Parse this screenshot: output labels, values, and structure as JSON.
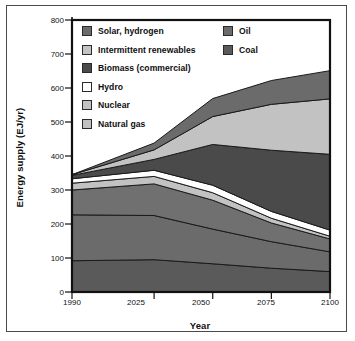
{
  "figure": {
    "axis": {
      "ylabel": "Energy supply (EJ/yr)",
      "xlabel": "Year",
      "yticks": [
        "800",
        "700",
        "600",
        "500",
        "400",
        "300",
        "200",
        "100",
        "0"
      ],
      "xticks": [
        "1990",
        "2025",
        "2050",
        "2075",
        "2100"
      ]
    },
    "legend": {
      "left_column": [
        {
          "label": "Solar, hydrogen",
          "swatch": "#6b6b6b"
        },
        {
          "label": "Intermittent renewables",
          "swatch": "#c2c2c2"
        },
        {
          "label": "Biomass (commercial)",
          "swatch": "#4a4a4a"
        },
        {
          "label": "Hydro",
          "swatch": "#ffffff"
        },
        {
          "label": "Nuclear",
          "swatch": "#c2c2c2"
        },
        {
          "label": "Natural gas",
          "swatch": "#c2c2c2"
        }
      ],
      "right_column": [
        {
          "label": "Oil",
          "swatch": "#6b6b6b"
        },
        {
          "label": "Coal",
          "swatch": "#5a5a5a"
        }
      ]
    },
    "colors": {
      "solar_hydrogen": "#6b6b6b",
      "intermittent_renewables": "#c2c2c2",
      "biomass_commercial": "#4a4a4a",
      "hydro": "#ffffff",
      "nuclear": "#c2c2c2",
      "natural_gas": "#707070",
      "oil": "#6b6b6b",
      "coal": "#5a5a5a",
      "frame": "#111111",
      "outer_frame": "#4a4a4a",
      "background": "#ffffff"
    }
  },
  "chart_data": {
    "type": "area",
    "title": "",
    "xlabel": "Year",
    "ylabel": "Energy supply (EJ/yr)",
    "xlim": [
      1990,
      2100
    ],
    "ylim": [
      0,
      800
    ],
    "xticks": [
      1990,
      2025,
      2050,
      2075,
      2100
    ],
    "yticks": [
      0,
      100,
      200,
      300,
      400,
      500,
      600,
      700,
      800
    ],
    "grid": false,
    "legend_position": "top-inside",
    "stacked": true,
    "stack_order_bottom_to_top": [
      "Coal",
      "Oil",
      "Natural gas",
      "Nuclear",
      "Hydro",
      "Biomass (commercial)",
      "Intermittent renewables",
      "Solar, hydrogen"
    ],
    "x": [
      1990,
      2025,
      2050,
      2075,
      2100
    ],
    "series": [
      {
        "name": "Coal",
        "values": [
          92,
          95,
          83,
          70,
          60
        ]
      },
      {
        "name": "Oil",
        "values": [
          135,
          130,
          102,
          78,
          58
        ]
      },
      {
        "name": "Natural gas",
        "values": [
          73,
          93,
          85,
          55,
          38
        ]
      },
      {
        "name": "Nuclear",
        "values": [
          20,
          22,
          22,
          14,
          8
        ]
      },
      {
        "name": "Hydro",
        "values": [
          13,
          18,
          22,
          20,
          18
        ]
      },
      {
        "name": "Biomass (commercial)",
        "values": [
          10,
          32,
          120,
          180,
          223
        ]
      },
      {
        "name": "Intermittent renewables",
        "values": [
          2,
          28,
          82,
          135,
          163
        ]
      },
      {
        "name": "Solar, hydrogen",
        "values": [
          0,
          20,
          53,
          70,
          83
        ]
      }
    ],
    "cumulative_totals": [
      345,
      438,
      569,
      622,
      651
    ]
  }
}
